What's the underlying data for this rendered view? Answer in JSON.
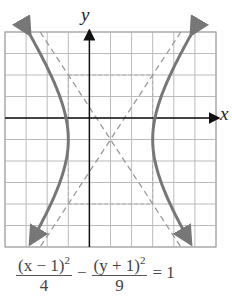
{
  "chart_data": {
    "type": "line",
    "title": "",
    "xlabel": "x",
    "ylabel": "y",
    "xlim": [
      -4,
      6
    ],
    "ylim": [
      -6,
      4
    ],
    "grid": true,
    "equation": "(x - 1)^2/4 - (y + 1)^2/9 = 1",
    "center": [
      1,
      -1
    ],
    "vertices": [
      [
        -1,
        -1
      ],
      [
        3,
        -1
      ]
    ],
    "a": 2,
    "b": 3,
    "asymptotes": [
      "y + 1 = (3/2)(x - 1)",
      "y + 1 = -(3/2)(x - 1)"
    ],
    "fundamental_rectangle": {
      "x": [
        -1,
        3
      ],
      "y": [
        -4,
        2
      ]
    },
    "series": [
      {
        "name": "left branch",
        "style": "solid"
      },
      {
        "name": "right branch",
        "style": "solid"
      },
      {
        "name": "asymptotes",
        "style": "dashed"
      }
    ]
  },
  "labels": {
    "x": "x",
    "y": "y"
  },
  "equation": {
    "num1": "(x − 1)",
    "exp1": "2",
    "den1": "4",
    "minus": "−",
    "num2": "(y + 1)",
    "exp2": "2",
    "den2": "9",
    "equals": "= 1"
  },
  "colors": {
    "curve": "#777777",
    "grid": "#bbbbbb",
    "axis": "#111111",
    "dash": "#999999"
  }
}
